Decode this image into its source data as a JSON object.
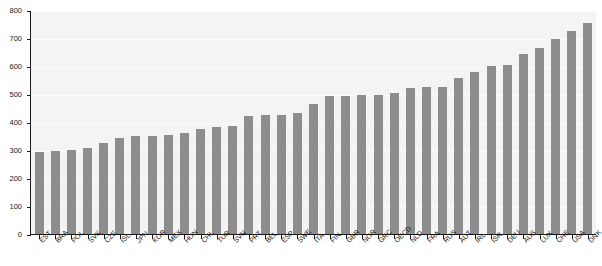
{
  "chart_data": {
    "type": "bar",
    "title": "",
    "xlabel": "",
    "ylabel": "",
    "ylim": [
      0,
      800
    ],
    "yticks": [
      0,
      100,
      200,
      300,
      400,
      500,
      600,
      700,
      800
    ],
    "grid": true,
    "legend": null,
    "bar_color": "#8d8d8d",
    "plot_background": "#f4f4f4",
    "categories": [
      "EST",
      "BRA",
      "POL",
      "SVK",
      "CZE",
      "ISL",
      "JPN",
      "KOR",
      "MEX",
      "HUN",
      "CHL",
      "TUR",
      "SVN",
      "PRT",
      "BEL",
      "ESP",
      "SWE",
      "ITA",
      "FIN",
      "GBR",
      "NOR",
      "GRC",
      "OECD",
      "NLD",
      "FRA",
      "RUS",
      "AUT",
      "IRL",
      "ISR",
      "DEU",
      "AUS",
      "LUX",
      "CHE",
      "USA",
      "DNK"
    ],
    "values": [
      297,
      301,
      303,
      310,
      330,
      347,
      352,
      355,
      358,
      365,
      378,
      385,
      390,
      425,
      428,
      430,
      437,
      468,
      495,
      498,
      499,
      500,
      508,
      525,
      528,
      530,
      560,
      582,
      605,
      608,
      648,
      668,
      700,
      727,
      757
    ]
  },
  "axis": {
    "y_tick_labels": [
      "800",
      "700",
      "600",
      "500",
      "400",
      "300",
      "200",
      "100",
      "0"
    ]
  }
}
